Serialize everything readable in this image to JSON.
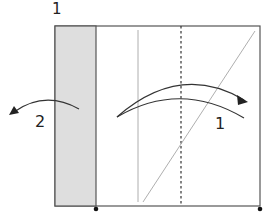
{
  "diagram": {
    "step_number": "1",
    "fold_labels": {
      "fold_1": "1",
      "fold_2": "2"
    },
    "colors": {
      "paper": "#ffffff",
      "shaded_flap": "#dedede",
      "outline": "#555555",
      "guide_line": "#999999",
      "arrow": "#333333",
      "dot": "#111111"
    }
  }
}
